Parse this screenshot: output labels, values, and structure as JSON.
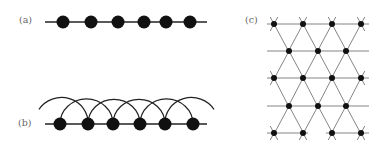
{
  "panels": {
    "a": {
      "label": "(a)",
      "description": "1D chain of atoms with nearest-neighbor bonds",
      "line": {
        "x1": 45,
        "x2": 207,
        "y": 22
      },
      "atoms_x": [
        63,
        91,
        118,
        144,
        166,
        190
      ]
    },
    "b": {
      "label": "(b)",
      "description": "1D chain with next-nearest-neighbor arcs",
      "line": {
        "x1": 45,
        "x2": 207,
        "y": 124
      },
      "atoms_x": [
        60,
        88,
        113,
        140,
        165,
        193
      ]
    },
    "c": {
      "label": "(c)",
      "description": "2D triangular lattice",
      "rows_y": [
        24,
        51,
        78,
        106,
        133
      ],
      "even_row_x": [
        274,
        303,
        332,
        361
      ],
      "odd_row_x": [
        289,
        318,
        346
      ]
    }
  },
  "colors": {
    "atom": "#111111",
    "bond": "#222222",
    "lattice_line": "#777777",
    "label": "#666666"
  }
}
